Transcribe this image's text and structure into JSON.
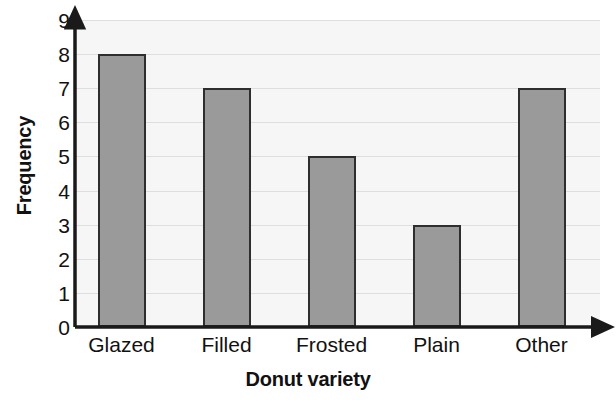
{
  "chart_data": {
    "type": "bar",
    "title": "",
    "categories": [
      "Glazed",
      "Filled",
      "Frosted",
      "Plain",
      "Other"
    ],
    "values": [
      8,
      7,
      5,
      3,
      7
    ],
    "xlabel": "Donut variety",
    "ylabel": "Frequency",
    "ylim": [
      0,
      9
    ],
    "ytick_labels": [
      "0",
      "1",
      "2",
      "3",
      "4",
      "5",
      "6",
      "7",
      "8",
      "9"
    ],
    "ytick_values": [
      0,
      1,
      2,
      3,
      4,
      5,
      6,
      7,
      8,
      9
    ],
    "grid": "horizontal",
    "legend": "none",
    "axis_style": "arrow-tipped",
    "colors": {
      "bar_fill": "#9a9a9a",
      "bar_outline": "#2e2e2e",
      "plot_background": "#f6f6f6",
      "gridline": "#dedede",
      "axis": "#1a1a1a",
      "text": "#111111",
      "figure_background": "#ffffff"
    }
  }
}
